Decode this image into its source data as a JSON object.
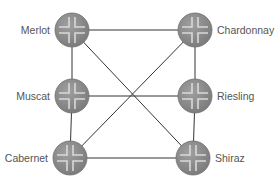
{
  "diagram": {
    "type": "network-topology",
    "colors": {
      "router_fill": "#8c8c8c",
      "router_edge": "#6e6e6e",
      "router_arrow": "#d9d9d9",
      "link": "#333333",
      "label": "#555555"
    },
    "nodes": [
      {
        "id": "merlot",
        "label": "Merlot",
        "x": 72,
        "y": 30,
        "side": "left"
      },
      {
        "id": "chardonnay",
        "label": "Chardonnay",
        "x": 195,
        "y": 30,
        "side": "right"
      },
      {
        "id": "muscat",
        "label": "Muscat",
        "x": 72,
        "y": 96,
        "side": "left"
      },
      {
        "id": "riesling",
        "label": "Riesling",
        "x": 195,
        "y": 96,
        "side": "right"
      },
      {
        "id": "cabernet",
        "label": "Cabernet",
        "x": 70,
        "y": 158,
        "side": "left"
      },
      {
        "id": "shiraz",
        "label": "Shiraz",
        "x": 193,
        "y": 158,
        "side": "right"
      }
    ],
    "links": [
      [
        "merlot",
        "chardonnay"
      ],
      [
        "merlot",
        "muscat"
      ],
      [
        "muscat",
        "cabernet"
      ],
      [
        "chardonnay",
        "riesling"
      ],
      [
        "riesling",
        "shiraz"
      ],
      [
        "cabernet",
        "shiraz"
      ],
      [
        "muscat",
        "riesling"
      ],
      [
        "merlot",
        "shiraz"
      ],
      [
        "chardonnay",
        "cabernet"
      ]
    ]
  }
}
